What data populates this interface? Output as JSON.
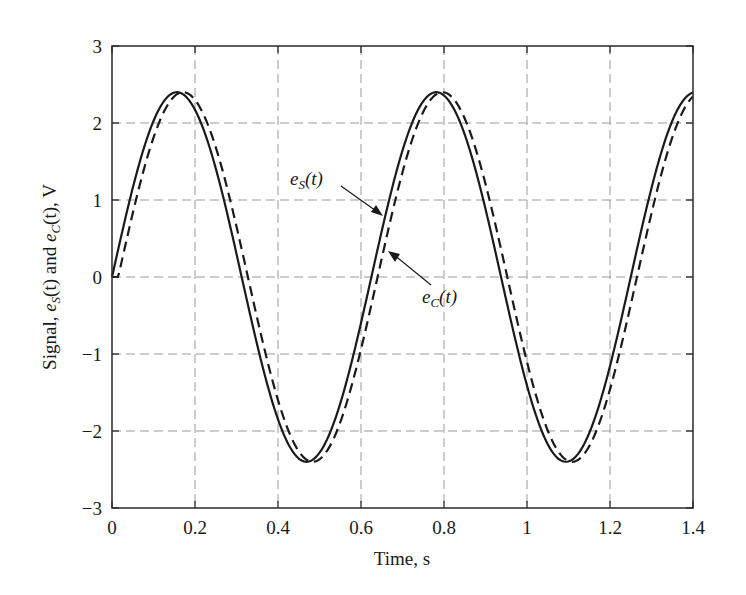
{
  "chart_data": {
    "type": "line",
    "title": "",
    "xlabel": "Time, s",
    "ylabel": "Signal, e_S(t) and e_C(t), V",
    "xlim": [
      0,
      1.4
    ],
    "ylim": [
      -3,
      3
    ],
    "x_ticks": [
      0,
      0.2,
      0.4,
      0.6,
      0.8,
      1,
      1.2,
      1.4
    ],
    "x_tick_labels": [
      "0",
      "0.2",
      "0.4",
      "0.6",
      "0.8",
      "1",
      "1.2",
      "1.4"
    ],
    "y_ticks": [
      -3,
      -2,
      -1,
      0,
      1,
      2,
      3
    ],
    "y_tick_labels": [
      "−3",
      "−2",
      "−1",
      "0",
      "1",
      "2",
      "3"
    ],
    "grid": true,
    "legend": "none (inline arrow annotations)",
    "series": [
      {
        "name": "e_S(t)",
        "style": "solid",
        "color": "#1a1a1a",
        "description": "sinusoid, amplitude 2.4 V, frequency 1.6 Hz, starts at 0",
        "amplitude": 2.4,
        "frequency_hz": 1.6,
        "delay_s": 0.0,
        "x": [
          0,
          0.05,
          0.1,
          0.156,
          0.2,
          0.25,
          0.3,
          0.35,
          0.4,
          0.469,
          0.5,
          0.55,
          0.6,
          0.65,
          0.7,
          0.781,
          0.85,
          0.9,
          0.95,
          1.0,
          1.05,
          1.094,
          1.15,
          1.2,
          1.25,
          1.3,
          1.35,
          1.4
        ],
        "values": [
          0,
          1.18,
          2.06,
          2.4,
          2.24,
          1.41,
          0.25,
          -0.98,
          -1.94,
          -2.4,
          -2.28,
          -1.63,
          -0.5,
          0.74,
          1.78,
          2.4,
          2.06,
          1.18,
          0.0,
          -1.18,
          -2.06,
          -2.4,
          -2.24,
          -1.41,
          -0.25,
          0.98,
          1.94,
          2.4
        ]
      },
      {
        "name": "e_C(t)",
        "style": "dashed",
        "color": "#1a1a1a",
        "description": "same sinusoid delayed ~0.015 s (lags e_S slightly)",
        "amplitude": 2.4,
        "frequency_hz": 1.6,
        "delay_s": 0.015,
        "x": [
          0,
          0.05,
          0.1,
          0.171,
          0.2,
          0.25,
          0.3,
          0.35,
          0.4,
          0.484,
          0.5,
          0.55,
          0.6,
          0.65,
          0.7,
          0.796,
          0.85,
          0.9,
          0.95,
          1.0,
          1.05,
          1.109,
          1.15,
          1.2,
          1.25,
          1.3,
          1.35,
          1.4
        ],
        "values": [
          0,
          0.84,
          1.83,
          2.4,
          2.36,
          1.74,
          0.61,
          -0.64,
          -1.73,
          -2.4,
          -2.38,
          -1.86,
          -0.86,
          0.39,
          1.52,
          2.4,
          2.22,
          1.5,
          0.36,
          -0.84,
          -1.83,
          -2.4,
          -2.36,
          -1.74,
          -0.61,
          0.64,
          1.73,
          2.38
        ]
      }
    ],
    "annotations": [
      {
        "text_base": "e",
        "text_sub": "S",
        "text_tail": "(t)",
        "points_to": "e_S(t) solid curve near t≈0.64 s, V≈0.8"
      },
      {
        "text_base": "e",
        "text_sub": "C",
        "text_tail": "(t)",
        "points_to": "e_C(t) dashed curve near t≈0.66 s, V≈0.4"
      }
    ]
  },
  "labels": {
    "xlabel": "Time, s",
    "ylabel_prefix": "Signal, ",
    "ylabel_e1": "e",
    "ylabel_sub1": "S",
    "ylabel_mid": "(t) and ",
    "ylabel_e2": "e",
    "ylabel_sub2": "C",
    "ylabel_tail": "(t), V",
    "annot_s_base": "e",
    "annot_s_sub": "S",
    "annot_s_tail": "(t)",
    "annot_c_base": "e",
    "annot_c_sub": "C",
    "annot_c_tail": "(t)"
  }
}
